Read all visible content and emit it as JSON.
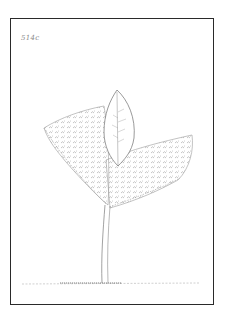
{
  "artwork": {
    "type": "botanical pencil sketch",
    "subject": "seedling with two cotyledons and a leaf",
    "label": "514c",
    "colors": {
      "frame": "#2a2a2a",
      "pencil": "#7a7a7a",
      "background": "#ffffff"
    }
  }
}
